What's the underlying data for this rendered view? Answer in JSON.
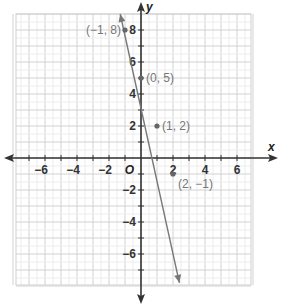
{
  "chart_data": {
    "type": "line",
    "title": "",
    "xlabel": "x",
    "ylabel": "y",
    "origin_label": "O",
    "xlim": [
      -8,
      7
    ],
    "ylim": [
      -8,
      9
    ],
    "grid": true,
    "x_ticks": [
      -6,
      -4,
      -2,
      2,
      4,
      6
    ],
    "y_ticks": [
      8,
      6,
      4,
      2,
      -2,
      -4,
      -6
    ],
    "x_tick_labels": [
      "−6",
      "−4",
      "−2",
      "2",
      "4",
      "6"
    ],
    "y_tick_labels": [
      "8",
      "6",
      "4",
      "2",
      "−2",
      "−4",
      "−6"
    ],
    "series": [
      {
        "name": "y = -3x + 5",
        "line_endpoints": [
          [
            -1.3,
            9.0
          ],
          [
            2.4,
            -7.8
          ]
        ],
        "arrows_both_ends": true,
        "color": "#777777"
      }
    ],
    "points": [
      {
        "x": -1,
        "y": 8,
        "label": "(−1, 8)"
      },
      {
        "x": 0,
        "y": 5,
        "label": "(0, 5)"
      },
      {
        "x": 1,
        "y": 2,
        "label": "(1, 2)"
      },
      {
        "x": 2,
        "y": -1,
        "label": "(2, −1)"
      }
    ]
  },
  "colors": {
    "grid": "#d2d2d2",
    "axis": "#333333",
    "line": "#777777"
  }
}
